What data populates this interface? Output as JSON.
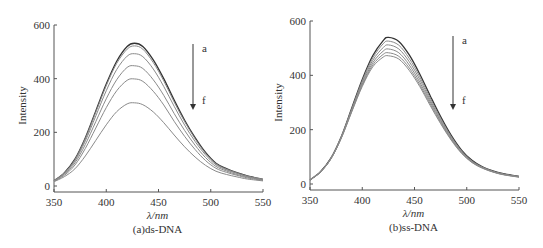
{
  "figure": {
    "colors": {
      "axis": "#555555",
      "text": "#333333",
      "curve_dark": "#333333",
      "curve_light": "#8a8a8a",
      "arrow": "#333333"
    }
  },
  "chart_data": [
    {
      "type": "line",
      "panel_label": "(a)ds-DNA",
      "title": "",
      "xlabel": "λ/nm",
      "ylabel": "Intensity",
      "xlim": [
        350,
        550
      ],
      "ylim": [
        0,
        600
      ],
      "xticks": [
        350,
        400,
        450,
        500,
        550
      ],
      "yticks": [
        0,
        200,
        400,
        600
      ],
      "grid": false,
      "peak_wavelength_nm": 427,
      "annotation": {
        "arrow": "downward",
        "top_label": "a",
        "bottom_label": "f"
      },
      "x": [
        350,
        360,
        370,
        380,
        390,
        400,
        410,
        420,
        427,
        435,
        445,
        455,
        465,
        475,
        485,
        495,
        505,
        515,
        525,
        535,
        550
      ],
      "series": [
        {
          "name": "a",
          "values": [
            20,
            50,
            100,
            180,
            280,
            380,
            465,
            520,
            532,
            520,
            470,
            400,
            320,
            245,
            180,
            125,
            85,
            65,
            50,
            38,
            25
          ]
        },
        {
          "name": "b",
          "values": [
            20,
            49,
            98,
            177,
            275,
            374,
            457,
            510,
            522,
            510,
            460,
            392,
            313,
            240,
            176,
            122,
            83,
            63,
            49,
            37,
            25
          ]
        },
        {
          "name": "c",
          "values": [
            19,
            47,
            93,
            168,
            261,
            355,
            434,
            484,
            493,
            482,
            436,
            371,
            297,
            227,
            166,
            116,
            79,
            60,
            47,
            35,
            24
          ]
        },
        {
          "name": "d",
          "values": [
            18,
            44,
            86,
            155,
            240,
            325,
            396,
            442,
            448,
            438,
            396,
            338,
            270,
            207,
            152,
            106,
            73,
            56,
            43,
            33,
            22
          ]
        },
        {
          "name": "e",
          "values": [
            17,
            40,
            78,
            140,
            216,
            292,
            355,
            394,
            399,
            390,
            353,
            302,
            241,
            185,
            136,
            95,
            66,
            51,
            40,
            30,
            21
          ]
        },
        {
          "name": "f",
          "values": [
            16,
            35,
            64,
            112,
            170,
            228,
            277,
            306,
            310,
            303,
            276,
            236,
            190,
            146,
            108,
            77,
            55,
            43,
            34,
            26,
            19
          ]
        }
      ]
    },
    {
      "type": "line",
      "panel_label": "(b)ss-DNA",
      "title": "",
      "xlabel": "λ/nm",
      "ylabel": "Intensity",
      "xlim": [
        350,
        550
      ],
      "ylim": [
        0,
        600
      ],
      "xticks": [
        350,
        400,
        450,
        500,
        550
      ],
      "yticks": [
        0,
        200,
        400,
        600
      ],
      "grid": false,
      "peak_wavelength_nm": 425,
      "annotation": {
        "arrow": "downward",
        "top_label": "a",
        "bottom_label": "f"
      },
      "x": [
        350,
        360,
        370,
        380,
        390,
        400,
        410,
        420,
        425,
        435,
        445,
        455,
        465,
        475,
        485,
        495,
        505,
        515,
        525,
        535,
        550
      ],
      "series": [
        {
          "name": "a",
          "values": [
            15,
            45,
            95,
            175,
            280,
            385,
            472,
            528,
            540,
            525,
            475,
            405,
            325,
            248,
            180,
            125,
            87,
            63,
            48,
            38,
            28
          ]
        },
        {
          "name": "b",
          "values": [
            15,
            45,
            95,
            174,
            277,
            380,
            464,
            516,
            526,
            511,
            462,
            395,
            317,
            242,
            176,
            122,
            85,
            62,
            47,
            37,
            27
          ]
        },
        {
          "name": "c",
          "values": [
            15,
            45,
            94,
            173,
            274,
            374,
            455,
            502,
            512,
            497,
            450,
            385,
            309,
            236,
            172,
            120,
            83,
            61,
            46,
            36,
            27
          ]
        },
        {
          "name": "d",
          "values": [
            15,
            44,
            93,
            171,
            271,
            368,
            446,
            489,
            497,
            483,
            438,
            375,
            302,
            231,
            168,
            117,
            82,
            60,
            45,
            35,
            26
          ]
        },
        {
          "name": "e",
          "values": [
            15,
            44,
            93,
            170,
            268,
            363,
            438,
            477,
            483,
            470,
            427,
            366,
            295,
            226,
            165,
            115,
            80,
            59,
            45,
            35,
            26
          ]
        },
        {
          "name": "f",
          "values": [
            15,
            44,
            92,
            169,
            266,
            359,
            431,
            467,
            472,
            460,
            418,
            359,
            289,
            222,
            162,
            113,
            79,
            58,
            44,
            34,
            25
          ]
        }
      ]
    }
  ]
}
